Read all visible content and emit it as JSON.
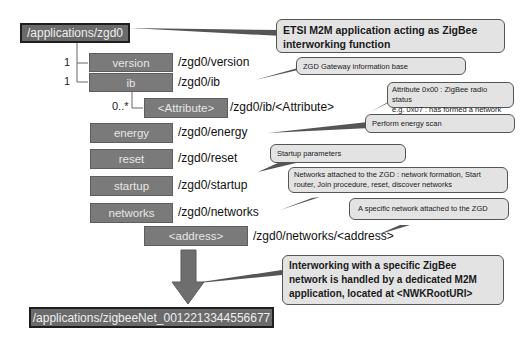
{
  "diagram": {
    "root": "/applications/zgd0",
    "nodes": [
      {
        "label": "version",
        "path": "/zgd0/version",
        "cardinality": "1"
      },
      {
        "label": "ib",
        "path": "/zgd0/ib",
        "cardinality": "1"
      },
      {
        "label": "<Attribute>",
        "path": "/zgd0/ib/<Attribute>",
        "cardinality": "0..*"
      },
      {
        "label": "energy",
        "path": "/zgd0/energy"
      },
      {
        "label": "reset",
        "path": "/zgd0/reset"
      },
      {
        "label": "startup",
        "path": "/zgd0/startup"
      },
      {
        "label": "networks",
        "path": "/zgd0/networks"
      },
      {
        "label": "<address>",
        "path": "/zgd0/networks/<address>"
      }
    ],
    "target": "/applications/zigbeeNet_0012213344556677",
    "callouts": {
      "root": "ETSI M2M application acting as ZigBee interworking function",
      "ib": "ZGD Gateway information base",
      "attribute_line1": "Attribute 0x00 : ZigBee radio status",
      "attribute_line2": "e.g. 0x07 : has formed a network",
      "energy": "Perform energy scan",
      "startup": "Startup parameters",
      "networks_line1": "Networks attached to the ZGD : network formation, Start",
      "networks_line2": "router, Join procedure, reset, discover networks",
      "address": "A specific network attached to the ZGD",
      "arrow": "Interworking with a specific ZigBee network is handled by a dedicated M2M application, located at <NWKRootURI>"
    },
    "colors": {
      "box_fill": "#7a7a7a",
      "box_text": "#e6e6e6",
      "callout_fill": "#e3e3e3",
      "callout_border": "#555555",
      "arrow": "#6e6e6e"
    }
  }
}
